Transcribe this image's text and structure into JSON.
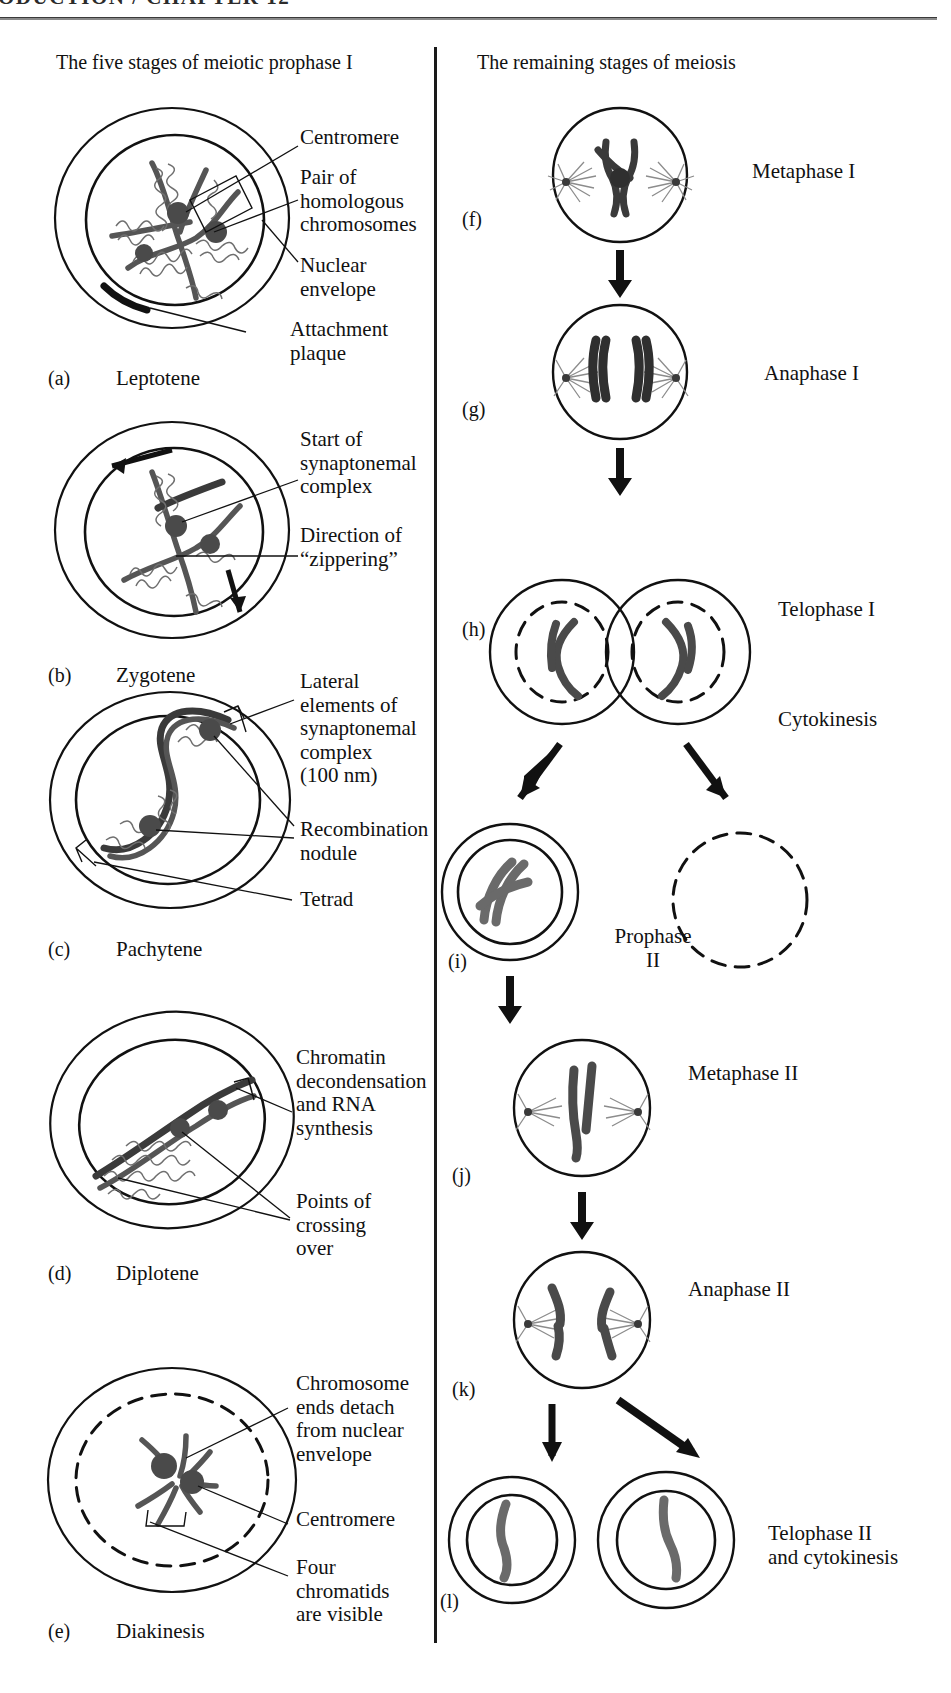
{
  "header": {
    "running_head": "ODUCTION / CHAPTER 12"
  },
  "columns": {
    "left_title": "The five stages of meiotic prophase I",
    "right_title": "The remaining stages of meiosis"
  },
  "left_panels": [
    {
      "letter": "(a)",
      "stage": "Leptotene",
      "callouts": [
        {
          "id": "centromere",
          "text": "Centromere"
        },
        {
          "id": "homologous-pair",
          "text": "Pair of\nhomologous\nchromosomes"
        },
        {
          "id": "nuclear-envelope",
          "text": "Nuclear\nenvelope"
        },
        {
          "id": "attachment-plaque",
          "text": "Attachment\nplaque"
        }
      ]
    },
    {
      "letter": "(b)",
      "stage": "Zygotene",
      "callouts": [
        {
          "id": "synaptonemal-start",
          "text": "Start of\nsynaptonemal\ncomplex"
        },
        {
          "id": "zippering-direction",
          "text": "Direction of\n“zippering”"
        }
      ]
    },
    {
      "letter": "(c)",
      "stage": "Pachytene",
      "callouts": [
        {
          "id": "lateral-elements",
          "text": "Lateral\nelements of\nsynaptonemal\ncomplex\n(100 nm)"
        },
        {
          "id": "recombination-nodule",
          "text": "Recombination\nnodule"
        },
        {
          "id": "tetrad",
          "text": "Tetrad"
        }
      ]
    },
    {
      "letter": "(d)",
      "stage": "Diplotene",
      "callouts": [
        {
          "id": "chromatin-decondensation",
          "text": "Chromatin\ndecondensation\nand RNA\nsynthesis"
        },
        {
          "id": "crossing-over-points",
          "text": "Points of\ncrossing\nover"
        }
      ]
    },
    {
      "letter": "(e)",
      "stage": "Diakinesis",
      "callouts": [
        {
          "id": "chromosome-ends-detach",
          "text": "Chromosome\nends detach\nfrom nuclear\nenvelope"
        },
        {
          "id": "centromere",
          "text": "Centromere"
        },
        {
          "id": "four-chromatids",
          "text": "Four\nchromatids\nare visible"
        }
      ]
    }
  ],
  "right_panels": [
    {
      "letter": "(f)",
      "label": "Metaphase I"
    },
    {
      "letter": "(g)",
      "label": "Anaphase I"
    },
    {
      "letter": "(h)",
      "label": "Telophase I"
    },
    {
      "letter": "",
      "label": "Cytokinesis"
    },
    {
      "letter": "(i)",
      "label": "Prophase\nII"
    },
    {
      "letter": "(j)",
      "label": "Metaphase II"
    },
    {
      "letter": "(k)",
      "label": "Anaphase II"
    },
    {
      "letter": "(l)",
      "label": "Telophase II\nand cytokinesis"
    }
  ],
  "colors": {
    "ink": "#111111",
    "chromatin": "#555555",
    "rule": "#8a8a8a",
    "paper": "#ffffff"
  }
}
